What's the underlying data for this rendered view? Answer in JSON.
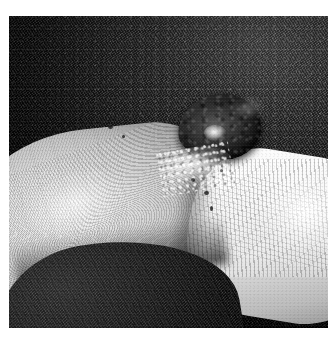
{
  "page": {
    "background_color": "#ffffff",
    "width": 336,
    "height": 342
  },
  "photograph": {
    "name": "clinical-photograph",
    "description": "Close-up grayscale clinical photograph of a dark raised nodular skin lesion on the dorsal/lateral aspect of a finger, resting on dark woven fabric",
    "frame": {
      "x": 9,
      "y": 16,
      "width": 319,
      "height": 312
    },
    "color_mode": "grayscale",
    "regions": [
      {
        "name": "background-fabric",
        "label": "Dark woven textile background",
        "tone": "#1a1a1a"
      },
      {
        "name": "finger-distal-pad",
        "label": "Finger pad with visible fingerprint ridges",
        "tone": "#d4d4d1"
      },
      {
        "name": "finger-proximal-knuckle",
        "label": "Proximal finger segment with knuckle creases",
        "tone": "#ececea"
      },
      {
        "name": "lesion-nodule",
        "label": "Dark pigmented raised nodule",
        "tone": "#2a2a27"
      },
      {
        "name": "lesion-crust",
        "label": "Pale crust and scale at lesion base",
        "tone": "#f2f2f0"
      },
      {
        "name": "foreground-fabric-fold",
        "label": "Dark fabric fold in lower-left foreground",
        "tone": "#101010"
      }
    ],
    "palette": {
      "fabric_dark": "#0d0d0d",
      "fabric_mid": "#2e2e2e",
      "skin_light": "#ececea",
      "skin_mid": "#c4c4c1",
      "skin_shadow": "#84847f",
      "lesion_dark": "#131312",
      "lesion_mid": "#3d3d3a",
      "highlight_white": "#ffffff"
    }
  }
}
